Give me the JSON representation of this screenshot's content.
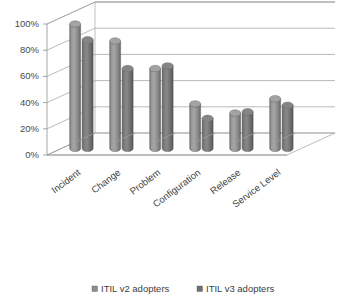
{
  "chart_data": {
    "type": "bar",
    "title": "",
    "subtitle": "",
    "xlabel": "",
    "ylabel": "",
    "ylim": [
      0,
      100
    ],
    "ytick_labels": [
      "0%",
      "20%",
      "40%",
      "60%",
      "80%",
      "100%"
    ],
    "ytick_values": [
      0,
      20,
      40,
      60,
      80,
      100
    ],
    "grid": true,
    "legend_position": "bottom",
    "style": "3d-cylinder-clustered",
    "categories": [
      "Incident",
      "Change",
      "Problem",
      "Configuration",
      "Release",
      "Service Level"
    ],
    "series": [
      {
        "name": "ITIL v2 adopters",
        "color": "#8d8d8d",
        "values": [
          95,
          82,
          61,
          34,
          27,
          38
        ]
      },
      {
        "name": "ITIL v3 adopters",
        "color": "#6f6f6f",
        "values": [
          83,
          61,
          63,
          23,
          28,
          33
        ]
      }
    ]
  },
  "legend": {
    "items": [
      {
        "label": "ITIL v2 adopters",
        "marker": "square-marker",
        "color": "#8d8d8d"
      },
      {
        "label": "ITIL v3 adopters",
        "marker": "square-marker",
        "color": "#6f6f6f"
      }
    ]
  },
  "colors": {
    "background": "#ffffff",
    "gridline": "#9c9c9c",
    "axis": "#8f8f8f",
    "text": "#3f3f3f",
    "series_v2": "#8d8d8d",
    "series_v3": "#6f6f6f"
  }
}
